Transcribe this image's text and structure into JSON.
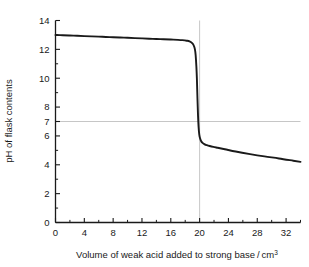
{
  "chart_data": {
    "type": "line",
    "title": "",
    "xlabel": "Volume of weak acid added to strong base / cm3",
    "xlabel_main": "Volume of weak acid added to strong base / cm",
    "xlabel_sup": "3",
    "ylabel": "pH of flask contents",
    "xlim": [
      0,
      34
    ],
    "ylim": [
      0,
      14
    ],
    "x_ticks_major": [
      0,
      4,
      8,
      12,
      16,
      20,
      24,
      28,
      32
    ],
    "x_tick_labels": [
      "0",
      "4",
      "8",
      "12",
      "16",
      "20",
      "24",
      "28",
      "32"
    ],
    "x_ticks_minor": [
      2,
      6,
      10,
      14,
      18,
      22,
      26,
      30,
      34
    ],
    "y_ticks_major": [
      0,
      2,
      4,
      6,
      7,
      8,
      10,
      12,
      14
    ],
    "y_tick_labels": [
      "0",
      "2",
      "4",
      "6",
      "7",
      "8",
      "10",
      "12",
      "14"
    ],
    "y_ticks_minor": [
      1,
      3,
      5,
      9,
      11,
      13
    ],
    "grid": {
      "horizontal_at_y": 7,
      "vertical_at_x": 20,
      "color": "#b8b8b8"
    },
    "legend": null,
    "series": [
      {
        "name": "titration curve",
        "color": "#1a1a1a",
        "line_width": 1.9,
        "x": [
          0,
          1,
          2,
          3,
          4,
          5,
          6,
          7,
          8,
          9,
          10,
          11,
          12,
          13,
          14,
          15,
          16,
          17,
          17.6,
          18.2,
          18.6,
          19.0,
          19.2,
          19.35,
          19.45,
          19.55,
          19.62,
          19.7,
          19.78,
          19.86,
          19.95,
          20.05,
          20.2,
          20.4,
          20.7,
          21.0,
          21.4,
          21.9,
          22.5,
          23.5,
          25,
          27,
          29,
          31,
          33,
          34
        ],
        "y": [
          13.0,
          12.98,
          12.96,
          12.94,
          12.92,
          12.9,
          12.88,
          12.86,
          12.84,
          12.82,
          12.8,
          12.78,
          12.76,
          12.74,
          12.72,
          12.7,
          12.68,
          12.66,
          12.64,
          12.6,
          12.55,
          12.42,
          12.25,
          12.0,
          11.6,
          10.8,
          10.0,
          8.6,
          7.4,
          6.6,
          6.1,
          5.85,
          5.65,
          5.52,
          5.42,
          5.36,
          5.3,
          5.24,
          5.18,
          5.08,
          4.92,
          4.74,
          4.58,
          4.44,
          4.28,
          4.2
        ]
      }
    ],
    "annotations": []
  },
  "figure": {
    "background": "#ffffff",
    "axis_color": "#1a1a1a"
  }
}
